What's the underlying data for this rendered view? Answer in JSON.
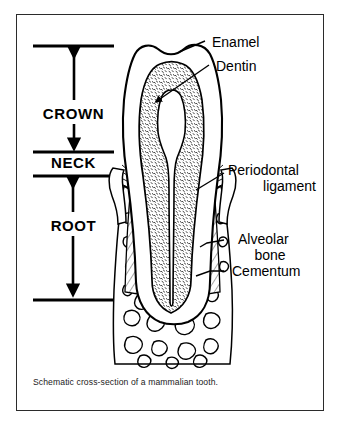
{
  "figure": {
    "title": "Schematic cross-section of a mammalian tooth",
    "caption": "Schematic cross-section of a mammalian tooth.",
    "background_color": "#ffffff",
    "ink_color": "#000000",
    "frame_color": "#2b2b2b"
  },
  "zones": [
    {
      "id": "crown",
      "label": "CROWN",
      "arrow": "double-headed-vertical",
      "top_rule_y": 46,
      "bottom_rule_y": 152
    },
    {
      "id": "neck",
      "label": "NECK",
      "arrow": "none",
      "top_rule_y": 152,
      "bottom_rule_y": 176
    },
    {
      "id": "root",
      "label": "ROOT",
      "arrow": "double-headed-vertical",
      "top_rule_y": 176,
      "bottom_rule_y": 300
    }
  ],
  "callouts": [
    {
      "id": "enamel",
      "lines": [
        "Enamel"
      ],
      "align": "left"
    },
    {
      "id": "dentin",
      "lines": [
        "Dentin"
      ],
      "align": "left"
    },
    {
      "id": "periodontal",
      "lines": [
        "Periodontal",
        "ligament"
      ],
      "align": "right"
    },
    {
      "id": "alveolar",
      "lines": [
        "Alveolar",
        "bone"
      ],
      "align": "center"
    },
    {
      "id": "cementum",
      "lines": [
        "Cementum"
      ],
      "align": "left"
    }
  ],
  "structures": [
    {
      "id": "enamel-layer",
      "name": "Enamel",
      "fill": "white",
      "description": "outer cap of the crown"
    },
    {
      "id": "dentin-body",
      "name": "Dentin",
      "fill": "stippled",
      "description": "bulk of tooth, stippled texture"
    },
    {
      "id": "pulp-cavity",
      "name": "Pulp cavity",
      "fill": "white",
      "description": "central canal running to root tip"
    },
    {
      "id": "cementum-layer",
      "name": "Cementum",
      "fill": "hatched",
      "description": "thin hatched layer over root dentin"
    },
    {
      "id": "periodontal-ligament",
      "name": "Periodontal ligament",
      "fill": "fibre-lines",
      "description": "fibres linking root to bone"
    },
    {
      "id": "alveolar-bone",
      "name": "Alveolar bone",
      "fill": "trabecular",
      "description": "spongy bone of the jaw socket"
    },
    {
      "id": "gingiva",
      "name": "Gum",
      "fill": "white",
      "description": "soft tissue collar at the neck"
    }
  ]
}
